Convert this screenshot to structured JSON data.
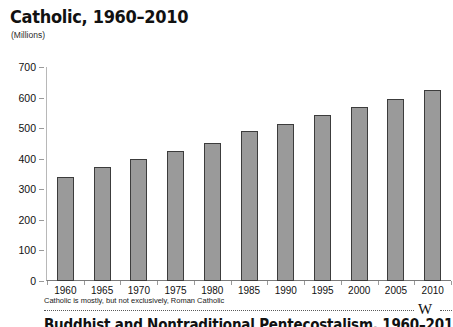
{
  "chart_data": {
    "type": "bar",
    "title": "Catholic, 1960–2010",
    "subtitle": "(Millions)",
    "xlabel": "",
    "ylabel": "Millions",
    "categories": [
      "1960",
      "1965",
      "1970",
      "1975",
      "1980",
      "1985",
      "1990",
      "1995",
      "2000",
      "2005",
      "2010"
    ],
    "values": [
      340,
      373,
      400,
      425,
      453,
      490,
      515,
      542,
      570,
      597,
      625
    ],
    "ylim": [
      0,
      700
    ],
    "yticks": [
      0,
      100,
      200,
      300,
      400,
      500,
      600,
      700
    ],
    "ytick_labels": [
      "0",
      "100",
      "200",
      "300",
      "400",
      "500",
      "600",
      "700"
    ],
    "grid": false,
    "legend": "none",
    "bar_color": "#9a9a9a",
    "bar_border_color": "#3c3c3c",
    "axis_color": "#9a9a9a"
  },
  "footnote": {
    "text": "Catholic is mostly, but not exclusively, Roman Catholic"
  },
  "rule": {
    "mark": "W"
  },
  "bottom": {
    "heading": "Buddhist and Nontraditional Pentecostalism, 1960–2010"
  }
}
